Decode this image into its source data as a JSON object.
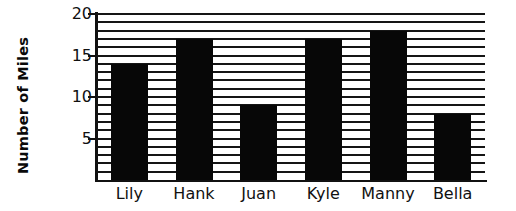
{
  "chart_data": {
    "type": "bar",
    "title": "",
    "xlabel": "",
    "ylabel": "Number of Miles",
    "categories": [
      "Lily",
      "Hank",
      "Juan",
      "Kyle",
      "Manny",
      "Bella"
    ],
    "values": [
      14,
      17,
      9,
      17,
      18,
      8
    ],
    "ylim": [
      0,
      20
    ],
    "y_tick_labels": [
      "20",
      "15",
      "10",
      "5"
    ],
    "y_tick_values": [
      20,
      15,
      10,
      5
    ],
    "y_minor_step": 1,
    "grid": "horizontal",
    "legend": "none",
    "bar_color": "#070707",
    "grid_color": "#151515",
    "axis_color": "#111111",
    "background_color": "#ffffff"
  }
}
